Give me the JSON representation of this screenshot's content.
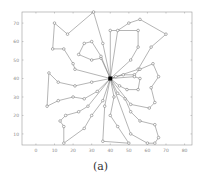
{
  "caption": "(a)",
  "chart_data": {
    "type": "line",
    "title": "",
    "xlabel": "",
    "ylabel": "",
    "xlim": [
      -7.5,
      84
    ],
    "ylim": [
      4,
      76
    ],
    "grid": false,
    "legend": null,
    "x_ticks": [
      0,
      10,
      20,
      30,
      40,
      50,
      60,
      70,
      80
    ],
    "y_ticks": [
      10,
      20,
      30,
      40,
      50,
      60,
      70
    ],
    "depot": {
      "x": 40,
      "y": 40,
      "marker": "filled-square"
    },
    "node_marker": "open-circle",
    "line_color": "#777777",
    "routes": [
      [
        [
          40,
          40
        ],
        [
          36,
          59
        ],
        [
          31,
          76
        ],
        [
          17,
          64
        ],
        [
          10,
          70
        ],
        [
          9,
          56
        ],
        [
          15,
          56
        ],
        [
          20,
          48
        ],
        [
          21,
          45
        ],
        [
          40,
          40
        ]
      ],
      [
        [
          40,
          40
        ],
        [
          35,
          51
        ],
        [
          30,
          50
        ],
        [
          23,
          53
        ],
        [
          26,
          59
        ],
        [
          30,
          60
        ],
        [
          35,
          52
        ],
        [
          40,
          40
        ]
      ],
      [
        [
          40,
          40
        ],
        [
          40,
          66
        ],
        [
          55,
          66
        ],
        [
          55,
          57
        ],
        [
          51,
          50
        ],
        [
          40,
          40
        ]
      ],
      [
        [
          40,
          40
        ],
        [
          44,
          66
        ],
        [
          50,
          70
        ],
        [
          56,
          72
        ],
        [
          70,
          64
        ],
        [
          62,
          57
        ],
        [
          55,
          45
        ],
        [
          43,
          41
        ],
        [
          40,
          40
        ]
      ],
      [
        [
          40,
          40
        ],
        [
          47,
          42
        ],
        [
          53,
          42
        ],
        [
          56,
          45
        ],
        [
          63,
          48
        ],
        [
          66,
          41
        ],
        [
          62,
          35
        ],
        [
          64,
          27
        ],
        [
          61,
          24
        ],
        [
          51,
          26
        ],
        [
          40,
          40
        ]
      ],
      [
        [
          40,
          40
        ],
        [
          45,
          36
        ],
        [
          49,
          34
        ],
        [
          55,
          34
        ],
        [
          56,
          40
        ],
        [
          53,
          41
        ],
        [
          40,
          40
        ]
      ],
      [
        [
          40,
          40
        ],
        [
          44,
          32
        ],
        [
          48,
          29
        ],
        [
          51,
          22
        ],
        [
          56,
          17
        ],
        [
          64,
          15
        ],
        [
          66,
          8
        ],
        [
          64,
          5
        ],
        [
          60,
          5
        ],
        [
          51,
          10
        ],
        [
          40,
          40
        ]
      ],
      [
        [
          40,
          40
        ],
        [
          42,
          30
        ],
        [
          40,
          20
        ],
        [
          44,
          14
        ],
        [
          50,
          5
        ],
        [
          36,
          6
        ],
        [
          37,
          25
        ],
        [
          40,
          40
        ]
      ],
      [
        [
          40,
          40
        ],
        [
          36,
          28
        ],
        [
          30,
          20
        ],
        [
          26,
          13
        ],
        [
          15,
          5
        ],
        [
          15,
          14
        ],
        [
          13,
          17
        ],
        [
          16,
          20
        ],
        [
          23,
          22
        ],
        [
          28,
          25
        ],
        [
          40,
          40
        ]
      ],
      [
        [
          40,
          40
        ],
        [
          33,
          33
        ],
        [
          26,
          29
        ],
        [
          20,
          30
        ],
        [
          12,
          28
        ],
        [
          6,
          25
        ],
        [
          7,
          43
        ],
        [
          12,
          38
        ],
        [
          21,
          36
        ],
        [
          30,
          38
        ],
        [
          40,
          40
        ]
      ]
    ]
  }
}
